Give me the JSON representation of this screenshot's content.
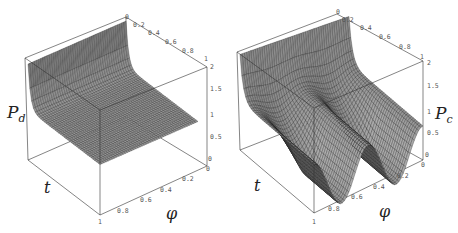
{
  "chart_data": [
    {
      "type": "surface3d",
      "title": "",
      "zlabel": "P_d",
      "zlabel_main": "P",
      "zlabel_sub": "d",
      "xlabel": "φ",
      "ylabel": "t",
      "x_ticks": [
        "0",
        "0.2",
        "0.4",
        "0.6",
        "0.8",
        "1"
      ],
      "y_ticks_back": [
        "0",
        "0.2",
        "0.4",
        "0.6",
        "0.8",
        "1"
      ],
      "z_ticks": [
        "0",
        "0.5",
        "1",
        "1.5",
        "2"
      ],
      "xlim": [
        0,
        1
      ],
      "ylim": [
        0,
        1
      ],
      "zlim": [
        0,
        2
      ],
      "description": "Surface starts near 2 at t=0 and quickly drops to a flat plane of 1 for all φ",
      "profile_t": [
        0,
        0.02,
        0.05,
        0.1,
        0.2,
        0.4,
        0.6,
        0.8,
        1.0
      ],
      "profile_value": [
        1.9,
        1.6,
        1.2,
        1.02,
        1.0,
        1.0,
        1.0,
        1.0,
        1.0
      ]
    },
    {
      "type": "surface3d",
      "title": "",
      "zlabel": "P_c",
      "zlabel_main": "P",
      "zlabel_sub": "c",
      "xlabel": "φ",
      "ylabel": "t",
      "x_ticks": [
        "0",
        "0.2",
        "0.4",
        "0.6",
        "0.8",
        "1"
      ],
      "y_ticks_back": [
        "0",
        "0.2",
        "0.4",
        "0.6",
        "0.8",
        "1"
      ],
      "z_ticks": [
        "0",
        "0.5",
        "1",
        "1.5",
        "2"
      ],
      "xlim": [
        0,
        1
      ],
      "ylim": [
        0,
        1
      ],
      "zlim": [
        0,
        2
      ],
      "description": "Surface starts near 2 at t=0, then develops an oscillation in φ with two troughs dropping toward 0 as t grows",
      "profile_phi": [
        0,
        0.1,
        0.25,
        0.4,
        0.5,
        0.6,
        0.75,
        0.9,
        1.0
      ],
      "profile_value_t1": [
        1.0,
        0.6,
        0.0,
        0.6,
        1.0,
        0.6,
        0.0,
        0.6,
        1.0
      ]
    }
  ],
  "left_panel": {
    "zlabel_main": "P",
    "zlabel_sub": "d",
    "t_label": "t",
    "phi_label": "φ",
    "top_ticks": [
      {
        "label": "0",
        "x": 125,
        "y": 19
      },
      {
        "label": "0.2",
        "x": 133,
        "y": 27
      },
      {
        "label": "0.4",
        "x": 148,
        "y": 35
      },
      {
        "label": "0.6",
        "x": 165,
        "y": 44
      },
      {
        "label": "0.8",
        "x": 182,
        "y": 53
      },
      {
        "label": "1",
        "x": 204,
        "y": 61
      },
      {
        "label": "2",
        "x": 210,
        "y": 69
      }
    ],
    "z_ticks": [
      {
        "label": "1.5",
        "x": 210,
        "y": 91
      },
      {
        "label": "1",
        "x": 210,
        "y": 117
      },
      {
        "label": "0.5",
        "x": 210,
        "y": 139
      },
      {
        "label": "0",
        "x": 208,
        "y": 161
      }
    ],
    "phi_ticks": [
      {
        "label": "0",
        "x": 206,
        "y": 171
      },
      {
        "label": "0.2",
        "x": 182,
        "y": 181
      },
      {
        "label": "0.4",
        "x": 160,
        "y": 192
      },
      {
        "label": "0.6",
        "x": 140,
        "y": 202
      },
      {
        "label": "0.8",
        "x": 117,
        "y": 213
      },
      {
        "label": "1",
        "x": 98,
        "y": 224
      }
    ]
  },
  "right_panel": {
    "zlabel_main": "P",
    "zlabel_sub": "c",
    "t_label": "t",
    "phi_label": "φ",
    "top_ticks": [
      {
        "label": "0",
        "x": 107,
        "y": 14
      },
      {
        "label": "0.2",
        "x": 113,
        "y": 22
      },
      {
        "label": "0.4",
        "x": 131,
        "y": 30
      },
      {
        "label": "0.6",
        "x": 150,
        "y": 39
      },
      {
        "label": "0.8",
        "x": 170,
        "y": 49
      },
      {
        "label": "1",
        "x": 191,
        "y": 59
      },
      {
        "label": "2",
        "x": 198,
        "y": 65
      }
    ],
    "z_ticks": [
      {
        "label": "1.5",
        "x": 198,
        "y": 88
      },
      {
        "label": "1",
        "x": 198,
        "y": 114
      },
      {
        "label": "0.5",
        "x": 198,
        "y": 135
      },
      {
        "label": "0",
        "x": 196,
        "y": 157
      }
    ],
    "phi_ticks": [
      {
        "label": "0",
        "x": 192,
        "y": 167
      },
      {
        "label": "0.2",
        "x": 168,
        "y": 178
      },
      {
        "label": "0.4",
        "x": 144,
        "y": 189
      },
      {
        "label": "0.6",
        "x": 122,
        "y": 199
      },
      {
        "label": "0.8",
        "x": 99,
        "y": 211
      },
      {
        "label": "1",
        "x": 83,
        "y": 224
      }
    ]
  }
}
